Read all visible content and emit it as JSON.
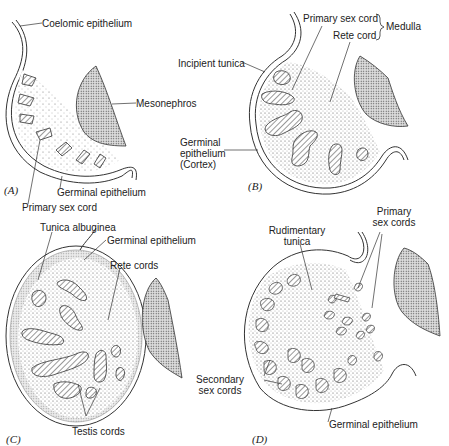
{
  "figure": {
    "panels": [
      {
        "id": "A",
        "letter": "(A)",
        "labels": {
          "coelomic_epithelium": "Coelomic epithelium",
          "mesonephros": "Mesonephros",
          "germinal_epithelium": "Germinal epithelium",
          "primary_sex_cord": "Primary sex cord"
        }
      },
      {
        "id": "B",
        "letter": "(B)",
        "labels": {
          "primary_sex_cord": "Primary sex cord",
          "rete_cord": "Rete cord",
          "medulla": "Medulla",
          "incipient_tunica": "Incipient tunica",
          "germinal_epithelium_l1": "Germinal",
          "germinal_epithelium_l2": "epithelium",
          "cortex": "(Cortex)"
        }
      },
      {
        "id": "C",
        "letter": "(C)",
        "labels": {
          "tunica_albuginea": "Tunica albuginea",
          "germinal_epithelium": "Germinal epithelium",
          "rete_cords": "Rete cords",
          "testis_cords": "Testis cords"
        }
      },
      {
        "id": "D",
        "letter": "(D)",
        "labels": {
          "rudimentary_tunica_l1": "Rudimentary",
          "rudimentary_tunica_l2": "tunica",
          "primary_sex_cords_l1": "Primary",
          "primary_sex_cords_l2": "sex cords",
          "secondary_sex_cords_l1": "Secondary",
          "secondary_sex_cords_l2": "sex cords",
          "germinal_epithelium": "Germinal epithelium"
        }
      }
    ]
  }
}
